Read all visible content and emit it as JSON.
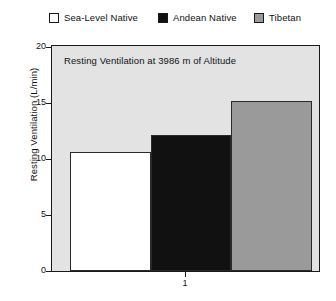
{
  "chart_data": {
    "type": "bar",
    "title": "Resting Ventilation at 3986 m of Altitude",
    "xlabel": "",
    "ylabel": "Resting Ventilation (L/min)",
    "categories": [
      "1"
    ],
    "series": [
      {
        "name": "Sea-Level Native",
        "values": [
          10.6
        ],
        "color": "#ffffff"
      },
      {
        "name": "Andean Native",
        "values": [
          12.1
        ],
        "color": "#111111"
      },
      {
        "name": "Tibetan",
        "values": [
          15.2
        ],
        "color": "#9a9a9a"
      }
    ],
    "ylim": [
      0,
      20
    ],
    "yticks": [
      0,
      5,
      10,
      15,
      20
    ],
    "ytick_labels": [
      "0",
      "5",
      "10",
      "15",
      "20"
    ],
    "xticks": [
      1
    ],
    "xtick_labels": [
      "1"
    ],
    "grid": false,
    "legend_position": "top",
    "plot_background": "#e3e3e3",
    "frame_color": "#1a1a1a"
  },
  "legend": {
    "items": [
      {
        "label": "Sea-Level Native",
        "color": "#ffffff"
      },
      {
        "label": "Andean Native",
        "color": "#111111"
      },
      {
        "label": "Tibetan",
        "color": "#9a9a9a"
      }
    ]
  },
  "axes": {
    "ylabel": "Resting Ventilation (L/min)",
    "ytick_labels": [
      "20",
      "15",
      "10",
      "5",
      "0"
    ],
    "xtick_label": "1"
  },
  "title": "Resting Ventilation at 3986 m of Altitude"
}
